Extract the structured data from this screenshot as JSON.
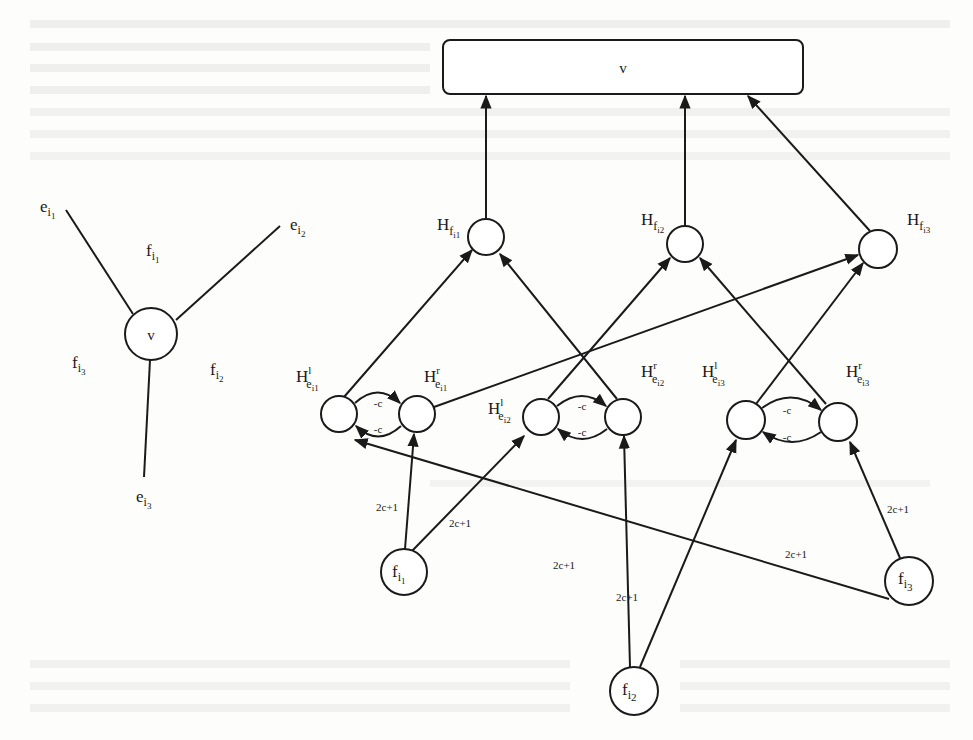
{
  "figure": {
    "colors": {
      "ink": "#1a1a1a",
      "paper": "#fdfdfc",
      "bleed": "#e4e4e2"
    },
    "left_vertex": {
      "center_label": "v",
      "edges": [
        {
          "id": "e_i1",
          "base": "e",
          "sub": "i",
          "subsub": "1"
        },
        {
          "id": "e_i2",
          "base": "e",
          "sub": "i",
          "subsub": "2"
        },
        {
          "id": "e_i3",
          "base": "e",
          "sub": "i",
          "subsub": "3"
        }
      ],
      "faces": [
        {
          "id": "f_i1",
          "base": "f",
          "sub": "i",
          "subsub": "1"
        },
        {
          "id": "f_i2",
          "base": "f",
          "sub": "i",
          "subsub": "2"
        },
        {
          "id": "f_i3",
          "base": "f",
          "sub": "i",
          "subsub": "3"
        }
      ]
    },
    "gadget": {
      "sink_label": "v",
      "face_hubs": [
        {
          "id": "Hf_i1",
          "base": "H",
          "sub": "f",
          "subsub": "i1"
        },
        {
          "id": "Hf_i2",
          "base": "H",
          "sub": "f",
          "subsub": "i2"
        },
        {
          "id": "Hf_i3",
          "base": "H",
          "sub": "f",
          "subsub": "i3"
        }
      ],
      "edge_nodes": [
        {
          "id": "He_i1_l",
          "base": "H",
          "sup": "l",
          "sub": "e",
          "subsub": "i1"
        },
        {
          "id": "He_i1_r",
          "base": "H",
          "sup": "r",
          "sub": "e",
          "subsub": "i1"
        },
        {
          "id": "He_i2_l",
          "base": "H",
          "sup": "l",
          "sub": "e",
          "subsub": "i2"
        },
        {
          "id": "He_i2_r",
          "base": "H",
          "sup": "r",
          "sub": "e",
          "subsub": "i2"
        },
        {
          "id": "He_i3_l",
          "base": "H",
          "sup": "l",
          "sub": "e",
          "subsub": "i3"
        },
        {
          "id": "He_i3_r",
          "base": "H",
          "sup": "r",
          "sub": "e",
          "subsub": "i3"
        }
      ],
      "face_sources": [
        {
          "id": "f_i1",
          "base": "f",
          "sub": "i",
          "subsub": "1"
        },
        {
          "id": "f_i2",
          "base": "f",
          "sub": "i",
          "subsub": "2"
        },
        {
          "id": "f_i3",
          "base": "f",
          "sub": "i",
          "subsub": "3"
        }
      ],
      "pair_weight": "-c",
      "source_weight": "2c+1"
    }
  }
}
